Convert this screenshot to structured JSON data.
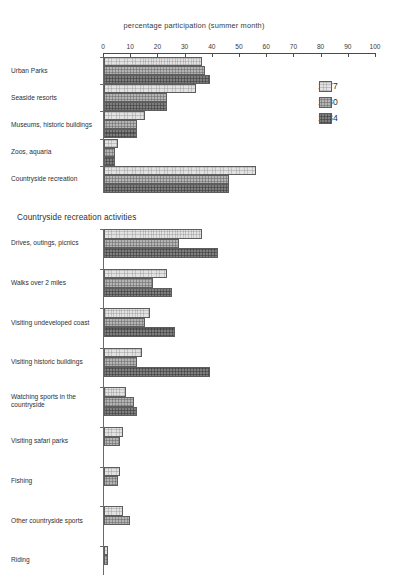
{
  "chart_data": {
    "type": "bar",
    "orientation": "horizontal",
    "title": "percentage participation (summer month)",
    "xlabel": "percentage participation (summer month)",
    "ylabel": "",
    "xlim": [
      0,
      100
    ],
    "xticks": [
      0,
      10,
      20,
      30,
      40,
      50,
      60,
      70,
      80,
      90,
      100
    ],
    "grid": false,
    "legend_position": "top-right",
    "legend": [
      "1977",
      "1980",
      "1984"
    ],
    "series": [
      {
        "name": "1977",
        "color": "#e2e2e2"
      },
      {
        "name": "1980",
        "color": "#b4b4b4"
      },
      {
        "name": "1984",
        "color": "#7e7e7e"
      }
    ],
    "panels": [
      {
        "heading": "",
        "categories": [
          "Urban Parks",
          "Seaside resorts",
          "Museums, historic buildings",
          "Zoos, aquaria",
          "Countryside recreation"
        ],
        "values": {
          "1977": [
            36,
            34,
            15,
            5,
            56
          ],
          "1980": [
            37,
            23,
            12,
            4,
            46
          ],
          "1984": [
            39,
            23,
            12,
            4,
            46
          ]
        }
      },
      {
        "heading": "Countryside recreation activities",
        "categories": [
          "Drives, outings, picnics",
          "Walks over 2 miles",
          "Visiting undeveloped coast",
          "Visiting historic buildings",
          "Watching sports in the\ncountryside",
          "Visiting safari parks",
          "Fishing",
          "Other countryside sports",
          "Riding"
        ],
        "values": {
          "1977": [
            36,
            23,
            17,
            14,
            8,
            7,
            6,
            7,
            1.5
          ],
          "1980": [
            27.5,
            18,
            15,
            12,
            11,
            6,
            5,
            9.5,
            1.5
          ],
          "1984": [
            42,
            25,
            26,
            39,
            12,
            0,
            0,
            0,
            0
          ]
        }
      }
    ]
  }
}
